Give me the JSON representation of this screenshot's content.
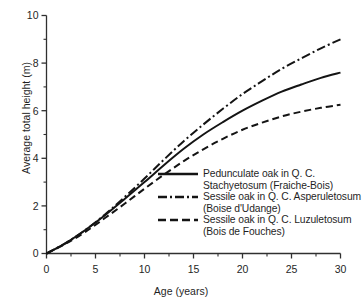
{
  "chart_data": {
    "type": "line",
    "title": "",
    "xlabel": "Age (years)",
    "ylabel": "Average total height (m)",
    "xlim": [
      0,
      30
    ],
    "ylim": [
      0,
      10
    ],
    "xticks": [
      0,
      5,
      10,
      15,
      20,
      25,
      30
    ],
    "xtick_labels": [
      "0",
      "5",
      "10",
      "15",
      "20",
      "25",
      "30"
    ],
    "xminor_ticks": [
      2.5,
      7.5,
      12.5,
      17.5,
      22.5,
      27.5
    ],
    "yticks": [
      0,
      2,
      4,
      6,
      8,
      10
    ],
    "ytick_labels": [
      "0",
      "2",
      "4",
      "6",
      "8",
      "10"
    ],
    "yminor_ticks": [
      1,
      3,
      5,
      7,
      9
    ],
    "grid": false,
    "legend_position": "inside-lower-right",
    "x": [
      0,
      2,
      4,
      6,
      8,
      10,
      12,
      14,
      16,
      18,
      20,
      22,
      24,
      26,
      28,
      30
    ],
    "series": [
      {
        "name": "Pedunculate oak in Q. C. Stachyetosum (Fraiche-Bois)",
        "label_line1": "Pedunculate oak in Q. C.",
        "label_line2": "Stachyetosum (Fraiche-Bois)",
        "style": "solid",
        "color": "#141414",
        "values": [
          0,
          0.45,
          1.0,
          1.62,
          2.3,
          3.0,
          3.72,
          4.4,
          5.0,
          5.52,
          6.0,
          6.42,
          6.8,
          7.1,
          7.38,
          7.6
        ]
      },
      {
        "name": "Sessile oak in Q. C. Asperuletosum (Boise d'Udange)",
        "label_line1": "Sessile oak in Q. C. Asperuletosum",
        "label_line2": "(Boise d'Udange)",
        "style": "dashdot",
        "color": "#141414",
        "values": [
          0,
          0.45,
          1.0,
          1.65,
          2.38,
          3.15,
          3.95,
          4.72,
          5.42,
          6.08,
          6.7,
          7.24,
          7.76,
          8.2,
          8.62,
          9.0
        ]
      },
      {
        "name": "Sessile oak in Q. C. Luzuletosum (Bois de Fouches)",
        "label_line1": "Sessile oak in Q. C. Luzuletosum",
        "label_line2": "(Bois de Fouches)",
        "style": "dashed",
        "color": "#141414",
        "values": [
          0,
          0.42,
          0.92,
          1.5,
          2.1,
          2.72,
          3.32,
          3.88,
          4.38,
          4.82,
          5.2,
          5.5,
          5.76,
          5.96,
          6.12,
          6.25
        ]
      }
    ]
  }
}
